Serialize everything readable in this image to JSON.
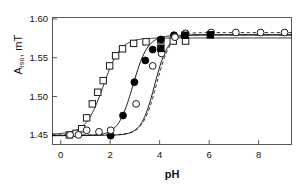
{
  "chart_data": {
    "type": "scatter",
    "title": "",
    "xlabel": "pH",
    "ylabel": "A",
    "ylabel_sub": "iso",
    "ylabel_unit": ", mT",
    "xlim": [
      -0.35,
      9.35
    ],
    "ylim": [
      1.4375,
      1.6025
    ],
    "xticks": [
      0,
      2,
      4,
      6,
      8
    ],
    "xtick_labels": [
      "0",
      "2",
      "4",
      "6",
      "8"
    ],
    "yticks": [
      1.45,
      1.5,
      1.55,
      1.6
    ],
    "ytick_labels": [
      "1.45",
      "1.50",
      "1.55",
      "1.60"
    ],
    "grid": false,
    "legend": "none",
    "series": [
      {
        "name": "Series 1",
        "marker": "open-square",
        "line": "solid",
        "color": "#1a1a1a",
        "fit_low": 1.4515,
        "fit_high": 1.5755,
        "fit_pka": 1.72,
        "fit_n": 1.25,
        "points": [
          {
            "x": 0.35,
            "y": 1.4505
          },
          {
            "x": 0.62,
            "y": 1.4525
          },
          {
            "x": 0.85,
            "y": 1.4585
          },
          {
            "x": 1.05,
            "y": 1.4725
          },
          {
            "x": 1.28,
            "y": 1.4905
          },
          {
            "x": 1.5,
            "y": 1.5055
          },
          {
            "x": 1.72,
            "y": 1.5205
          },
          {
            "x": 1.98,
            "y": 1.5395
          },
          {
            "x": 2.22,
            "y": 1.5525
          },
          {
            "x": 2.5,
            "y": 1.5615
          },
          {
            "x": 2.95,
            "y": 1.5685
          },
          {
            "x": 3.45,
            "y": 1.5705
          },
          {
            "x": 4.05,
            "y": 1.572
          },
          {
            "x": 4.55,
            "y": 1.5715
          },
          {
            "x": 5.05,
            "y": 1.5715
          }
        ]
      },
      {
        "name": "Series 2",
        "marker": "filled-circle",
        "line": "solid",
        "color": "#000000",
        "fit_low": 1.4495,
        "fit_high": 1.579,
        "fit_pka": 2.92,
        "fit_n": 1.45,
        "points": [
          {
            "x": 2.02,
            "y": 1.4495
          },
          {
            "x": 2.52,
            "y": 1.4755
          },
          {
            "x": 2.98,
            "y": 1.5185
          },
          {
            "x": 3.42,
            "y": 1.5465
          },
          {
            "x": 3.72,
            "y": 1.5605
          },
          {
            "x": 4.05,
            "y": 1.5735
          },
          {
            "x": 4.58,
            "y": 1.579
          },
          {
            "x": 5.02,
            "y": 1.579
          }
        ]
      },
      {
        "name": "Series 3",
        "marker": "open-circle",
        "line": "dashed",
        "color": "#1a1a1a",
        "fit_low": 1.4505,
        "fit_high": 1.5825,
        "fit_pka": 3.88,
        "fit_n": 1.55,
        "points": [
          {
            "x": 0.38,
            "y": 1.4505
          },
          {
            "x": 0.72,
            "y": 1.4505
          },
          {
            "x": 1.05,
            "y": 1.4565
          },
          {
            "x": 1.55,
            "y": 1.4545
          },
          {
            "x": 2.02,
            "y": 1.4565
          },
          {
            "x": 3.05,
            "y": 1.4905
          },
          {
            "x": 3.72,
            "y": 1.5395
          },
          {
            "x": 4.08,
            "y": 1.5555
          },
          {
            "x": 4.62,
            "y": 1.5765
          },
          {
            "x": 5.05,
            "y": 1.5815
          },
          {
            "x": 6.08,
            "y": 1.5825
          },
          {
            "x": 7.08,
            "y": 1.5825
          },
          {
            "x": 8.08,
            "y": 1.5825
          },
          {
            "x": 9.05,
            "y": 1.5825
          }
        ]
      },
      {
        "name": "Series 4",
        "marker": "filled-square",
        "line": "solid",
        "color": "#000000",
        "fit_low": 1.45,
        "fit_high": 1.58,
        "fit_pka": 3.8,
        "fit_n": 1.6,
        "points": [
          {
            "x": 4.05,
            "y": 1.562
          },
          {
            "x": 5.02,
            "y": 1.579
          },
          {
            "x": 6.05,
            "y": 1.5795
          }
        ]
      }
    ]
  }
}
